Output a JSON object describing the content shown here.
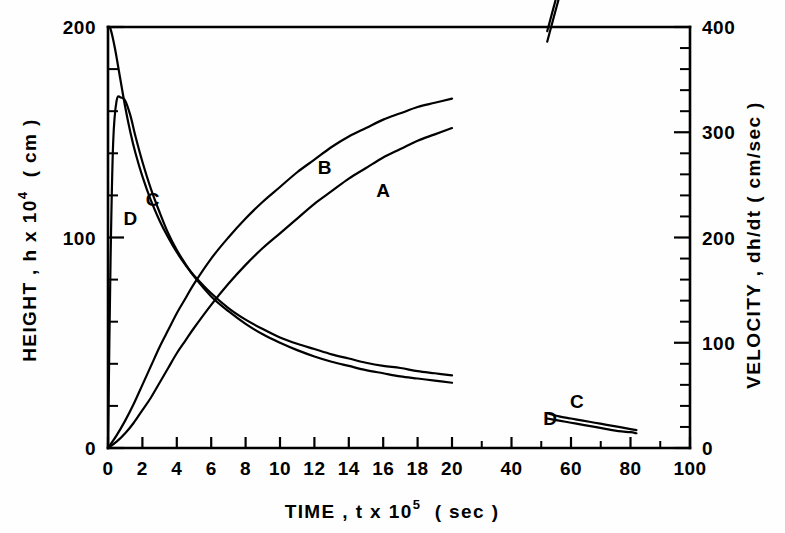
{
  "chart_data": {
    "type": "line",
    "title": "",
    "xlabel": "TIME , t x 10",
    "xlabel_exp": "5",
    "xlabel_unit": "( sec )",
    "ylabel_left": "HEIGHT , h x 10",
    "ylabel_left_exp": "4",
    "ylabel_left_unit": "( cm )",
    "ylabel_right": "VELOCITY , dh/dt  ( cm/sec )",
    "grid": false,
    "legend_position": "inline-curve-labels",
    "xlim": [
      0,
      100
    ],
    "x_break_at": 20,
    "ylim_left": [
      0,
      200
    ],
    "ylim_right": [
      0,
      400
    ],
    "xticks_labeled": [
      "0",
      "2",
      "4",
      "6",
      "8",
      "10",
      "12",
      "14",
      "16",
      "18",
      "20",
      "40",
      "60",
      "80",
      "100"
    ],
    "xtick_values": [
      0,
      2,
      4,
      6,
      8,
      10,
      12,
      14,
      16,
      18,
      20,
      40,
      60,
      80,
      100
    ],
    "xticks_minor": [
      30,
      50,
      70,
      90
    ],
    "yticks_left_labeled": [
      "0",
      "100",
      "200"
    ],
    "ytick_left_values": [
      0,
      100,
      200
    ],
    "yticks_left_minor": [
      20,
      40,
      60,
      80,
      120,
      140,
      160,
      180
    ],
    "yticks_right_labeled": [
      "0",
      "100",
      "200",
      "300",
      "400"
    ],
    "ytick_right_values": [
      0,
      100,
      200,
      300,
      400
    ],
    "yticks_right_minor": [
      20,
      40,
      60,
      80,
      120,
      140,
      160,
      180,
      220,
      240,
      260,
      280,
      320,
      340,
      360,
      380
    ],
    "series": [
      {
        "name": "A",
        "axis": "left",
        "quantity": "height",
        "label": "A",
        "label_x": 16.0,
        "label_y": 122,
        "points_segment1": [
          [
            0,
            0
          ],
          [
            0.5,
            3
          ],
          [
            1,
            7
          ],
          [
            1.5,
            12
          ],
          [
            2,
            18
          ],
          [
            2.5,
            24
          ],
          [
            3,
            31
          ],
          [
            3.5,
            38
          ],
          [
            4,
            45
          ],
          [
            4.5,
            51
          ],
          [
            5,
            57
          ],
          [
            6,
            68
          ],
          [
            7,
            78
          ],
          [
            8,
            87
          ],
          [
            9,
            95
          ],
          [
            10,
            102
          ],
          [
            11,
            109
          ],
          [
            12,
            116
          ],
          [
            13,
            122
          ],
          [
            14,
            128
          ],
          [
            15,
            133
          ],
          [
            16,
            138
          ],
          [
            17,
            142
          ],
          [
            18,
            146
          ],
          [
            19,
            149
          ],
          [
            20,
            152
          ]
        ],
        "points_segment2": [
          [
            52,
            193
          ],
          [
            56,
            214
          ],
          [
            60,
            234
          ],
          [
            64,
            252
          ],
          [
            68,
            268
          ],
          [
            72,
            283
          ],
          [
            76,
            297
          ],
          [
            80,
            310
          ],
          [
            84,
            322
          ],
          [
            88,
            334
          ],
          [
            92,
            345
          ],
          [
            96,
            356
          ],
          [
            100,
            366
          ]
        ],
        "label2": "A",
        "label2_x": 68,
        "label2_y": 264
      },
      {
        "name": "B",
        "axis": "left",
        "quantity": "height",
        "label": "B",
        "label_x": 12.6,
        "label_y": 133,
        "points_segment1": [
          [
            0,
            0
          ],
          [
            0.5,
            6
          ],
          [
            1,
            13
          ],
          [
            1.5,
            21
          ],
          [
            2,
            30
          ],
          [
            2.5,
            39
          ],
          [
            3,
            48
          ],
          [
            3.5,
            56
          ],
          [
            4,
            64
          ],
          [
            4.5,
            71
          ],
          [
            5,
            78
          ],
          [
            6,
            90
          ],
          [
            7,
            100
          ],
          [
            8,
            109
          ],
          [
            9,
            117
          ],
          [
            10,
            124
          ],
          [
            11,
            131
          ],
          [
            12,
            137
          ],
          [
            13,
            143
          ],
          [
            14,
            148
          ],
          [
            15,
            152
          ],
          [
            16,
            156
          ],
          [
            17,
            159
          ],
          [
            18,
            162
          ],
          [
            19,
            164
          ],
          [
            20,
            166
          ]
        ],
        "points_segment2": [
          [
            52,
            198
          ],
          [
            56,
            219
          ],
          [
            60,
            240
          ],
          [
            64,
            258
          ],
          [
            68,
            274
          ],
          [
            72,
            289
          ],
          [
            76,
            302
          ],
          [
            80,
            315
          ],
          [
            84,
            327
          ],
          [
            88,
            339
          ],
          [
            92,
            350
          ],
          [
            96,
            361
          ],
          [
            100,
            371
          ]
        ],
        "label2": "B",
        "label2_x": 63,
        "label2_y": 282
      },
      {
        "name": "C",
        "axis": "right",
        "quantity": "velocity",
        "label": "C",
        "label_x": 2.6,
        "label_y": 236,
        "points_segment1": [
          [
            0,
            400
          ],
          [
            0.15,
            398
          ],
          [
            0.4,
            380
          ],
          [
            0.7,
            352
          ],
          [
            1.0,
            324
          ],
          [
            1.3,
            300
          ],
          [
            1.6,
            280
          ],
          [
            2.0,
            258
          ],
          [
            2.5,
            235
          ],
          [
            3,
            216
          ],
          [
            3.5,
            200
          ],
          [
            4,
            186
          ],
          [
            4.5,
            174
          ],
          [
            5,
            164
          ],
          [
            6,
            147
          ],
          [
            7,
            133
          ],
          [
            8,
            122
          ],
          [
            9,
            113
          ],
          [
            10,
            105
          ],
          [
            11,
            99
          ],
          [
            12,
            94
          ],
          [
            13,
            89
          ],
          [
            14,
            85
          ],
          [
            15,
            81
          ],
          [
            16,
            78
          ],
          [
            17,
            76
          ],
          [
            18,
            73
          ],
          [
            19,
            71
          ],
          [
            20,
            69
          ]
        ],
        "points_segment2": [
          [
            52,
            33
          ],
          [
            56,
            30
          ],
          [
            60,
            28
          ],
          [
            64,
            26
          ],
          [
            68,
            24
          ],
          [
            72,
            22
          ],
          [
            76,
            20
          ],
          [
            80,
            18
          ],
          [
            82,
            17
          ]
        ],
        "label2": "C",
        "label2_x": 62,
        "label2_y": 44
      },
      {
        "name": "D",
        "axis": "right",
        "quantity": "velocity",
        "label": "D",
        "label_x": 1.3,
        "label_y": 218,
        "points_segment1": [
          [
            0,
            0
          ],
          [
            0.15,
            180
          ],
          [
            0.3,
            290
          ],
          [
            0.5,
            330
          ],
          [
            0.75,
            333
          ],
          [
            1.0,
            330
          ],
          [
            1.3,
            316
          ],
          [
            1.6,
            296
          ],
          [
            2.0,
            272
          ],
          [
            2.5,
            246
          ],
          [
            3,
            224
          ],
          [
            3.5,
            204
          ],
          [
            4,
            188
          ],
          [
            4.5,
            175
          ],
          [
            5,
            163
          ],
          [
            6,
            144
          ],
          [
            7,
            130
          ],
          [
            8,
            118
          ],
          [
            9,
            108
          ],
          [
            10,
            100
          ],
          [
            11,
            93
          ],
          [
            12,
            87
          ],
          [
            13,
            82
          ],
          [
            14,
            78
          ],
          [
            15,
            74
          ],
          [
            16,
            71
          ],
          [
            17,
            68
          ],
          [
            18,
            66
          ],
          [
            19,
            64
          ],
          [
            20,
            62
          ]
        ],
        "points_segment2": [
          [
            52,
            28
          ],
          [
            56,
            26
          ],
          [
            60,
            24
          ],
          [
            64,
            22
          ],
          [
            68,
            20
          ],
          [
            72,
            18
          ],
          [
            76,
            16
          ],
          [
            80,
            15
          ],
          [
            82,
            14
          ]
        ],
        "label2": "D",
        "label2_x": 53,
        "label2_y": 28
      }
    ]
  },
  "colors": {
    "ink": "#000000",
    "paper": "#ffffff"
  }
}
